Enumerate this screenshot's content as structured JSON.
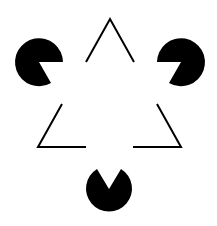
{
  "figure": {
    "name": "Kanizsa triangle illusion",
    "background": "#ffffff",
    "ink": "#000000",
    "pacmen": [
      {
        "cx": 39,
        "cy": 62,
        "r": 24,
        "mouth": "pointing-right-down"
      },
      {
        "cx": 181,
        "cy": 62,
        "r": 24,
        "mouth": "pointing-left-down"
      },
      {
        "cx": 109,
        "cy": 189,
        "r": 23,
        "mouth": "pointing-up"
      }
    ],
    "outline_corners": [
      {
        "points": "86,62 110,19 134,62"
      },
      {
        "points": "62,104 38,147 86,147"
      },
      {
        "points": "157,104 181,147 133,147"
      }
    ]
  }
}
